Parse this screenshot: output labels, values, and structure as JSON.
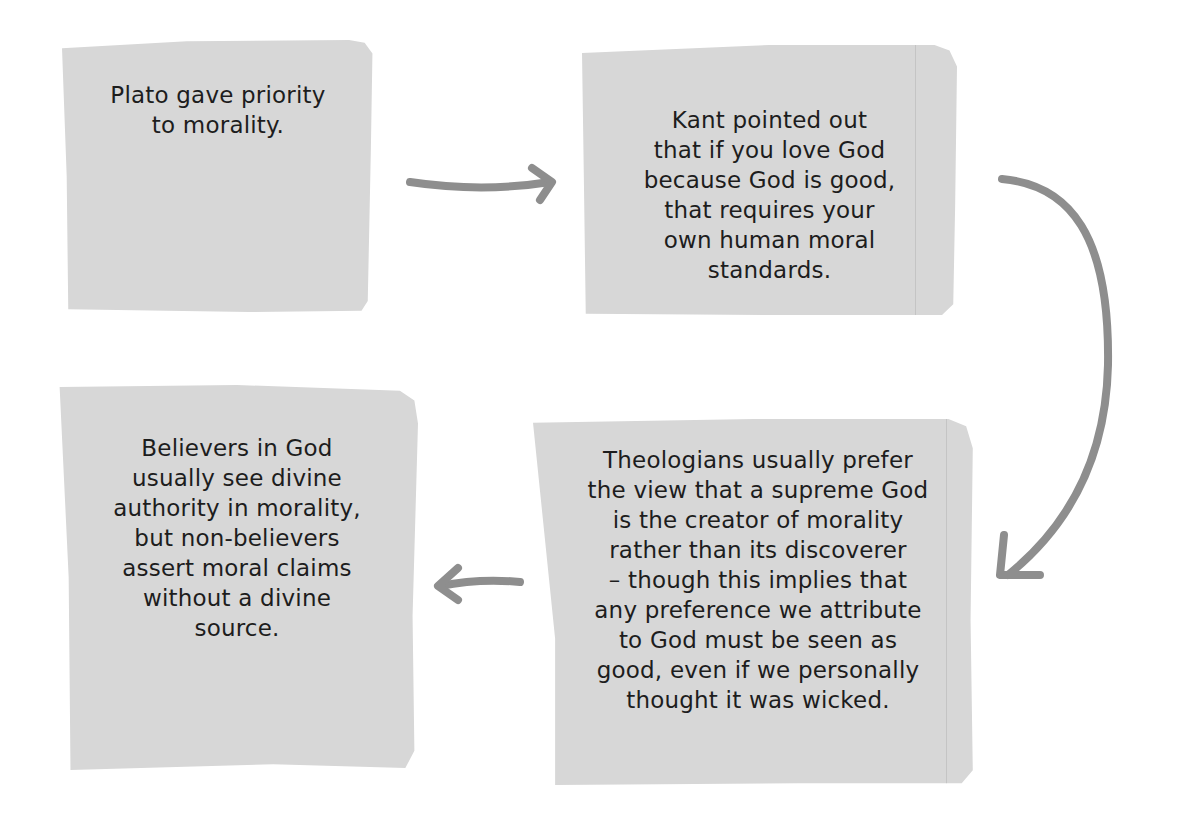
{
  "diagram": {
    "type": "cyclic-flow",
    "card_color": "#d7d7d7",
    "text_color": "#1d1d1d",
    "arrow_color": "#8e8e8e",
    "nodes": [
      {
        "id": "plato",
        "text": "Plato gave priority\nto morality."
      },
      {
        "id": "kant",
        "text": "Kant pointed out\nthat if you love God\nbecause God is good,\nthat requires your\nown human moral\nstandards."
      },
      {
        "id": "theologians",
        "text": "Theologians usually prefer\nthe view that a supreme God\nis the creator of morality\nrather than its discoverer\n– though this implies that\nany preference we attribute\nto God must be seen as\ngood, even if we personally\nthought it was wicked."
      },
      {
        "id": "believers",
        "text": "Believers in God\nusually see divine\nauthority in morality,\nbut non-believers\nassert moral claims\nwithout a divine\nsource."
      }
    ],
    "edges": [
      {
        "from": "plato",
        "to": "kant",
        "icon": "arrow-right-icon"
      },
      {
        "from": "kant",
        "to": "theologians",
        "icon": "curved-arrow-down-icon"
      },
      {
        "from": "theologians",
        "to": "believers",
        "icon": "arrow-left-icon"
      }
    ]
  }
}
